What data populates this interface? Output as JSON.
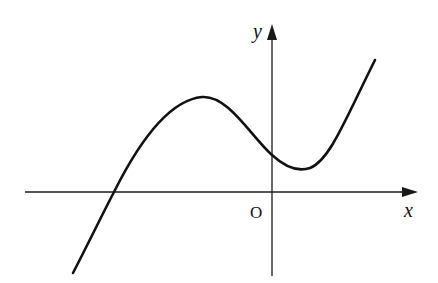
{
  "figure": {
    "type": "function-graph",
    "axes": {
      "x_label": "x",
      "y_label": "y",
      "origin_label": "O"
    },
    "colors": {
      "axis": "#1a1a1a",
      "curve": "#111111",
      "background": "#ffffff"
    },
    "curve_features": [
      {
        "feature": "x-intercept",
        "position": "negative x"
      },
      {
        "feature": "local maximum",
        "position": "negative x, above x-axis"
      },
      {
        "feature": "y-intercept",
        "position": "positive y"
      },
      {
        "feature": "local minimum",
        "position": "positive x, above x-axis"
      }
    ]
  }
}
